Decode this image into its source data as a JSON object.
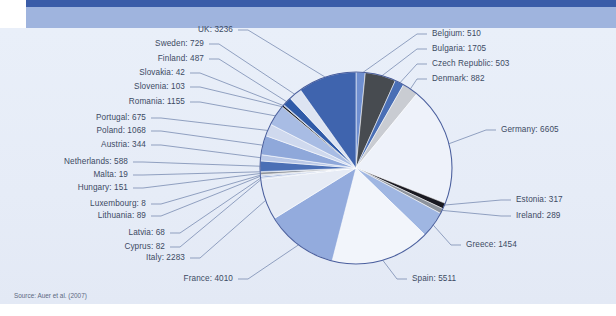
{
  "figure": {
    "source_note": "Source: Auer et al. (2007)",
    "background_color": "#e8eef8",
    "header_rule_color": "#3a5ca8",
    "header_band_color": "#9fb4de",
    "label_color": "#3c4a63",
    "leader_line_color": "#6a7ea8",
    "pie_outline_color": "#4a5f9e"
  },
  "chart_data": {
    "type": "pie",
    "title": "",
    "subtitle": "",
    "xlabel": "",
    "ylabel": "",
    "legend_position": "callout-labels",
    "grid": false,
    "total": 32915,
    "start_angle_deg": 0,
    "direction": "clockwise",
    "categories": [
      "Belgium",
      "Bulgaria",
      "Czech Republic",
      "Denmark",
      "Germany",
      "Estonia",
      "Ireland",
      "Greece",
      "Spain",
      "France",
      "Italy",
      "Cyprus",
      "Latvia",
      "Lithuania",
      "Luxembourg",
      "Hungary",
      "Malta",
      "Netherlands",
      "Austria",
      "Poland",
      "Portugal",
      "Romania",
      "Slovenia",
      "Slovakia",
      "Finland",
      "Sweden",
      "UK"
    ],
    "values": [
      510,
      1705,
      503,
      882,
      6605,
      317,
      289,
      1454,
      5511,
      4010,
      2283,
      82,
      68,
      89,
      8,
      151,
      19,
      588,
      344,
      1068,
      675,
      1155,
      103,
      42,
      487,
      729,
      3236
    ],
    "colors": [
      "#6f8fd0",
      "#474b50",
      "#4a6fb5",
      "#c9ccd2",
      "#eef2fa",
      "#1a1a22",
      "#8d939c",
      "#9fb6e2",
      "#f2f5fb",
      "#93abdd",
      "#e6ebf5",
      "#cfd9ee",
      "#3f64ae",
      "#b9c8e7",
      "#2b2f36",
      "#8f959e",
      "#6f8fd0",
      "#4a6fb5",
      "#b9c8e7",
      "#8fa8da",
      "#cfd9ee",
      "#a8bce4",
      "#12141a",
      "#6f8fd0",
      "#2f5aa8",
      "#dde4f2",
      "#3f64ae"
    ],
    "labels": [
      {
        "name": "Belgium",
        "value": 510,
        "text": "Belgium: 510"
      },
      {
        "name": "Bulgaria",
        "value": 1705,
        "text": "Bulgaria: 1705"
      },
      {
        "name": "Czech Republic",
        "value": 503,
        "text": "Czech Republic: 503"
      },
      {
        "name": "Denmark",
        "value": 882,
        "text": "Denmark: 882"
      },
      {
        "name": "Germany",
        "value": 6605,
        "text": "Germany: 6605"
      },
      {
        "name": "Estonia",
        "value": 317,
        "text": "Estonia: 317"
      },
      {
        "name": "Ireland",
        "value": 289,
        "text": "Ireland: 289"
      },
      {
        "name": "Greece",
        "value": 1454,
        "text": "Greece: 1454"
      },
      {
        "name": "Spain",
        "value": 5511,
        "text": "Spain: 5511"
      },
      {
        "name": "France",
        "value": 4010,
        "text": "France: 4010"
      },
      {
        "name": "Italy",
        "value": 2283,
        "text": "Italy: 2283"
      },
      {
        "name": "Cyprus",
        "value": 82,
        "text": "Cyprus: 82"
      },
      {
        "name": "Latvia",
        "value": 68,
        "text": "Latvia: 68"
      },
      {
        "name": "Lithuania",
        "value": 89,
        "text": "Lithuania: 89"
      },
      {
        "name": "Luxembourg",
        "value": 8,
        "text": "Luxembourg: 8"
      },
      {
        "name": "Hungary",
        "value": 151,
        "text": "Hungary: 151"
      },
      {
        "name": "Malta",
        "value": 19,
        "text": "Malta: 19"
      },
      {
        "name": "Netherlands",
        "value": 588,
        "text": "Netherlands: 588"
      },
      {
        "name": "Austria",
        "value": 344,
        "text": "Austria: 344"
      },
      {
        "name": "Poland",
        "value": 1068,
        "text": "Poland: 1068"
      },
      {
        "name": "Portugal",
        "value": 675,
        "text": "Portugal: 675"
      },
      {
        "name": "Romania",
        "value": 1155,
        "text": "Romania: 1155"
      },
      {
        "name": "Slovenia",
        "value": 103,
        "text": "Slovenia: 103"
      },
      {
        "name": "Slovakia",
        "value": 42,
        "text": "Slovakia: 42"
      },
      {
        "name": "Finland",
        "value": 487,
        "text": "Finland: 487"
      },
      {
        "name": "Sweden",
        "value": 729,
        "text": "Sweden: 729"
      },
      {
        "name": "UK",
        "value": 3236,
        "text": "UK: 3236"
      }
    ]
  },
  "label_layout": [
    {
      "key": "Belgium",
      "side": "r",
      "x": 432,
      "y": 29,
      "anchor_idx": 0
    },
    {
      "key": "Bulgaria",
      "side": "r",
      "x": 432,
      "y": 44,
      "anchor_idx": 1
    },
    {
      "key": "Czech Republic",
      "side": "r",
      "x": 432,
      "y": 59,
      "anchor_idx": 2
    },
    {
      "key": "Denmark",
      "side": "r",
      "x": 432,
      "y": 74,
      "anchor_idx": 3
    },
    {
      "key": "Germany",
      "side": "r",
      "x": 501,
      "y": 125,
      "anchor_idx": 4
    },
    {
      "key": "Estonia",
      "side": "r",
      "x": 516,
      "y": 195,
      "anchor_idx": 5
    },
    {
      "key": "Ireland",
      "side": "r",
      "x": 516,
      "y": 211,
      "anchor_idx": 6
    },
    {
      "key": "Greece",
      "side": "r",
      "x": 466,
      "y": 240,
      "anchor_idx": 7
    },
    {
      "key": "Spain",
      "side": "r",
      "x": 412,
      "y": 274,
      "anchor_idx": 8
    },
    {
      "key": "France",
      "side": "l",
      "x": 233,
      "y": 274,
      "anchor_idx": 9
    },
    {
      "key": "Italy",
      "side": "l",
      "x": 185,
      "y": 253,
      "anchor_idx": 10
    },
    {
      "key": "Cyprus",
      "side": "l",
      "x": 165,
      "y": 242,
      "anchor_idx": 11
    },
    {
      "key": "Latvia",
      "side": "l",
      "x": 165,
      "y": 228,
      "anchor_idx": 12
    },
    {
      "key": "Lithuania",
      "side": "l",
      "x": 146,
      "y": 211,
      "anchor_idx": 13
    },
    {
      "key": "Luxembourg",
      "side": "l",
      "x": 146,
      "y": 199,
      "anchor_idx": 14
    },
    {
      "key": "Hungary",
      "side": "l",
      "x": 128,
      "y": 183,
      "anchor_idx": 15
    },
    {
      "key": "Malta",
      "side": "l",
      "x": 128,
      "y": 170,
      "anchor_idx": 16
    },
    {
      "key": "Netherlands",
      "side": "l",
      "x": 128,
      "y": 157,
      "anchor_idx": 17
    },
    {
      "key": "Austria",
      "side": "l",
      "x": 146,
      "y": 140,
      "anchor_idx": 18
    },
    {
      "key": "Poland",
      "side": "l",
      "x": 146,
      "y": 126,
      "anchor_idx": 19
    },
    {
      "key": "Portugal",
      "side": "l",
      "x": 146,
      "y": 113,
      "anchor_idx": 20
    },
    {
      "key": "Romania",
      "side": "l",
      "x": 185,
      "y": 97,
      "anchor_idx": 21
    },
    {
      "key": "Slovenia",
      "side": "l",
      "x": 185,
      "y": 82,
      "anchor_idx": 22
    },
    {
      "key": "Slovakia",
      "side": "l",
      "x": 185,
      "y": 68,
      "anchor_idx": 23
    },
    {
      "key": "Finland",
      "side": "l",
      "x": 204,
      "y": 54,
      "anchor_idx": 24
    },
    {
      "key": "Sweden",
      "side": "l",
      "x": 204,
      "y": 39,
      "anchor_idx": 25
    },
    {
      "key": "UK",
      "side": "l",
      "x": 233,
      "y": 25,
      "anchor_idx": 26
    }
  ]
}
